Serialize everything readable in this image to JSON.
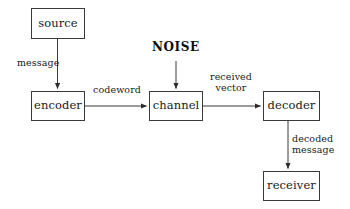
{
  "diagram": {
    "background_color": "#ffffff",
    "line_color": "#3a3a3a",
    "text_color": "#1a1a1a",
    "nodes": [
      {
        "id": "source",
        "label": "source",
        "x": 31,
        "y": 8,
        "w": 54,
        "h": 31
      },
      {
        "id": "encoder",
        "label": "encoder",
        "x": 31,
        "y": 91,
        "w": 54,
        "h": 30
      },
      {
        "id": "channel",
        "label": "channel",
        "x": 149,
        "y": 91,
        "w": 54,
        "h": 30
      },
      {
        "id": "decoder",
        "label": "decoder",
        "x": 263,
        "y": 91,
        "w": 57,
        "h": 30
      },
      {
        "id": "receiver",
        "label": "receiver",
        "x": 263,
        "y": 171,
        "w": 57,
        "h": 30
      }
    ],
    "noise": {
      "label": "NOISE",
      "x": 152,
      "y": 40
    },
    "edges": [
      {
        "id": "source-to-encoder",
        "from": "source",
        "to": "encoder",
        "label": "message",
        "direction": "down"
      },
      {
        "id": "encoder-to-channel",
        "from": "encoder",
        "to": "channel",
        "label": "codeword",
        "direction": "right"
      },
      {
        "id": "noise-to-channel",
        "from": "NOISE",
        "to": "channel",
        "label": "",
        "direction": "down"
      },
      {
        "id": "channel-to-decoder",
        "from": "channel",
        "to": "decoder",
        "label": "received vector",
        "direction": "right"
      },
      {
        "id": "decoder-to-receiver",
        "from": "decoder",
        "to": "receiver",
        "label": "decoded message",
        "direction": "down"
      }
    ],
    "labels": {
      "message": "message",
      "codeword": "codeword",
      "received_line1": "received",
      "received_line2": "vector",
      "decoded_line1": "decoded",
      "decoded_line2": "message"
    }
  }
}
